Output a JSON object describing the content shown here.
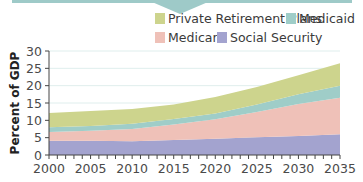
{
  "chart_data": {
    "type": "area",
    "stacked": true,
    "title": "",
    "xlabel": "",
    "ylabel": "Percent of GDP",
    "x": [
      2000,
      2005,
      2010,
      2015,
      2020,
      2025,
      2030,
      2035
    ],
    "xticks": [
      2000,
      2005,
      2010,
      2015,
      2020,
      2025,
      2030,
      2035
    ],
    "yticks": [
      0,
      5,
      10,
      15,
      20,
      25,
      30
    ],
    "ylim": [
      0,
      30
    ],
    "xlim": [
      2000,
      2035
    ],
    "grid": "horizontal",
    "legend_position": "top-right",
    "series": [
      {
        "name": "Social Security",
        "color": "#a3a3cf",
        "values": [
          4.1,
          4.1,
          4.0,
          4.3,
          4.7,
          5.1,
          5.5,
          6.0
        ]
      },
      {
        "name": "Medicare",
        "color": "#efc1b8",
        "values": [
          2.5,
          2.9,
          3.5,
          4.5,
          5.6,
          7.3,
          9.2,
          10.5
        ]
      },
      {
        "name": "Medicaid",
        "color": "#9fcdc8",
        "values": [
          1.4,
          1.4,
          1.5,
          1.6,
          1.7,
          2.2,
          2.8,
          3.5
        ]
      },
      {
        "name": "Private Retirement Plans",
        "color": "#cdd48d",
        "values": [
          4.1,
          4.3,
          4.3,
          4.2,
          4.7,
          5.0,
          5.5,
          6.5
        ]
      }
    ]
  },
  "legend": {
    "items": [
      {
        "label": "Private Retirement Plans",
        "color": "#cdd48d"
      },
      {
        "label": "Medicaid",
        "color": "#9fcdc8"
      },
      {
        "label": "Medicare",
        "color": "#efc1b8"
      },
      {
        "label": "Social Security",
        "color": "#a3a3cf"
      }
    ]
  },
  "axis": {
    "y_title": "Percent of GDP",
    "y_labels": [
      "0",
      "5",
      "10",
      "15",
      "20",
      "25",
      "30"
    ],
    "x_labels": [
      "2000",
      "2005",
      "2010",
      "2015",
      "2020",
      "2025",
      "2030",
      "2035"
    ]
  },
  "banner": {
    "color": "#9ecac8"
  }
}
